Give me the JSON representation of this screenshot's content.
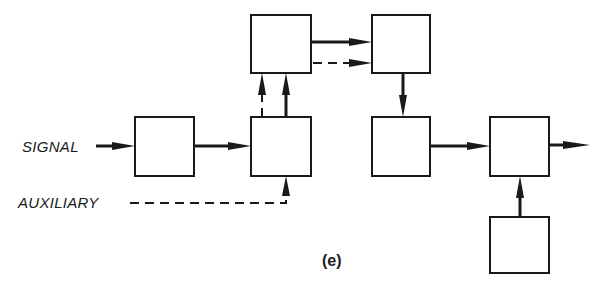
{
  "diagram": {
    "type": "block-diagram",
    "caption": "(e)",
    "inputs": {
      "signal_label": "SIGNAL",
      "auxiliary_label": "AUXILIARY"
    },
    "blocks": [
      {
        "id": "A",
        "label": "",
        "row": "middle",
        "col": 1
      },
      {
        "id": "B",
        "label": "",
        "row": "middle",
        "col": 2
      },
      {
        "id": "C",
        "label": "",
        "row": "top",
        "col": 2
      },
      {
        "id": "D",
        "label": "",
        "row": "top",
        "col": 3
      },
      {
        "id": "E",
        "label": "",
        "row": "middle",
        "col": 3
      },
      {
        "id": "F",
        "label": "",
        "row": "middle",
        "col": 4
      },
      {
        "id": "G",
        "label": "",
        "row": "bottom",
        "col": 4
      }
    ],
    "connections": [
      {
        "from": "SIGNAL",
        "to": "A",
        "style": "solid"
      },
      {
        "from": "A",
        "to": "B",
        "style": "solid"
      },
      {
        "from": "AUXILIARY",
        "to": "B",
        "style": "dashed"
      },
      {
        "from": "B",
        "to": "C",
        "style": "solid"
      },
      {
        "from": "B",
        "to": "C",
        "style": "dashed"
      },
      {
        "from": "C",
        "to": "D",
        "style": "solid"
      },
      {
        "from": "C",
        "to": "D",
        "style": "dashed"
      },
      {
        "from": "D",
        "to": "E",
        "style": "solid"
      },
      {
        "from": "E",
        "to": "F",
        "style": "solid"
      },
      {
        "from": "G",
        "to": "F",
        "style": "solid"
      },
      {
        "from": "F",
        "to": "OUTPUT",
        "style": "solid"
      }
    ],
    "colors": {
      "ink": "#1a1a1a",
      "background": "#ffffff"
    }
  }
}
